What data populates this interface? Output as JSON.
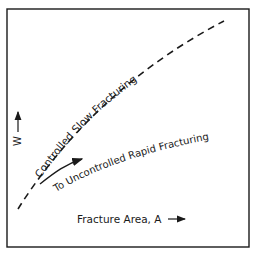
{
  "diagram": {
    "curve_label": "Controlled Slow Fracturing",
    "arrow_label": "To Uncontrolled Rapid Fracturing",
    "y_axis_label": "W",
    "x_axis_label": "Fracture Area, A",
    "line_color": "#1a1a1a",
    "background": "#ffffff"
  }
}
